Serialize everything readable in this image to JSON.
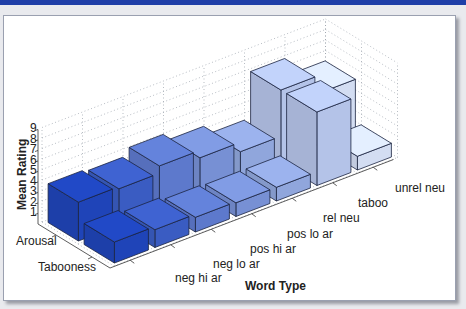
{
  "chart_data": {
    "type": "bar3d",
    "title": "",
    "xlabel": "Word Type",
    "ylabel": "Mean Rating",
    "zlabel": "",
    "categories": [
      "neg hi ar",
      "neg lo ar",
      "pos hi ar",
      "pos lo ar",
      "rel neu",
      "taboo",
      "unrel neu"
    ],
    "series": [
      {
        "name": "Arousal",
        "values": [
          3.7,
          3.5,
          4.2,
          3.5,
          2.6,
          7.0,
          5.3
        ]
      },
      {
        "name": "Tabooness",
        "values": [
          2.0,
          1.7,
          1.4,
          1.3,
          1.3,
          7.0,
          1.3
        ]
      }
    ],
    "yticks": [
      1,
      2,
      3,
      4,
      5,
      6,
      7,
      8,
      9
    ],
    "ylim": [
      0,
      9
    ],
    "grid": true,
    "colors": {
      "neg hi ar": "#1f44b8",
      "neg lo ar": "#3a5cc2",
      "pos hi ar": "#5d79cc",
      "pos lo ar": "#7790d4",
      "rel neu": "#90a6dc",
      "taboo": "#b4c3e8",
      "unrel neu": "#d3ddf2"
    }
  },
  "labels": {
    "ylabel": "Mean Rating",
    "xlabel": "Word Type",
    "rows": [
      "Arousal",
      "Tabooness"
    ],
    "categories": [
      "neg hi ar",
      "neg lo ar",
      "pos hi ar",
      "pos lo ar",
      "rel neu",
      "taboo",
      "unrel neu"
    ],
    "yticks": [
      "1",
      "2",
      "3",
      "4",
      "5",
      "6",
      "7",
      "8",
      "9"
    ]
  }
}
